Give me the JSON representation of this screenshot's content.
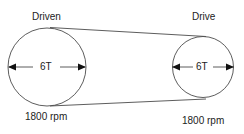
{
  "diagram": {
    "driven": {
      "title": "Driven",
      "teeth": "6T",
      "speed": "1800 rpm"
    },
    "drive": {
      "title": "Drive",
      "teeth": "6T",
      "speed": "1800 rpm"
    },
    "colors": {
      "stroke": "#333333",
      "arrow": "#111111"
    }
  }
}
